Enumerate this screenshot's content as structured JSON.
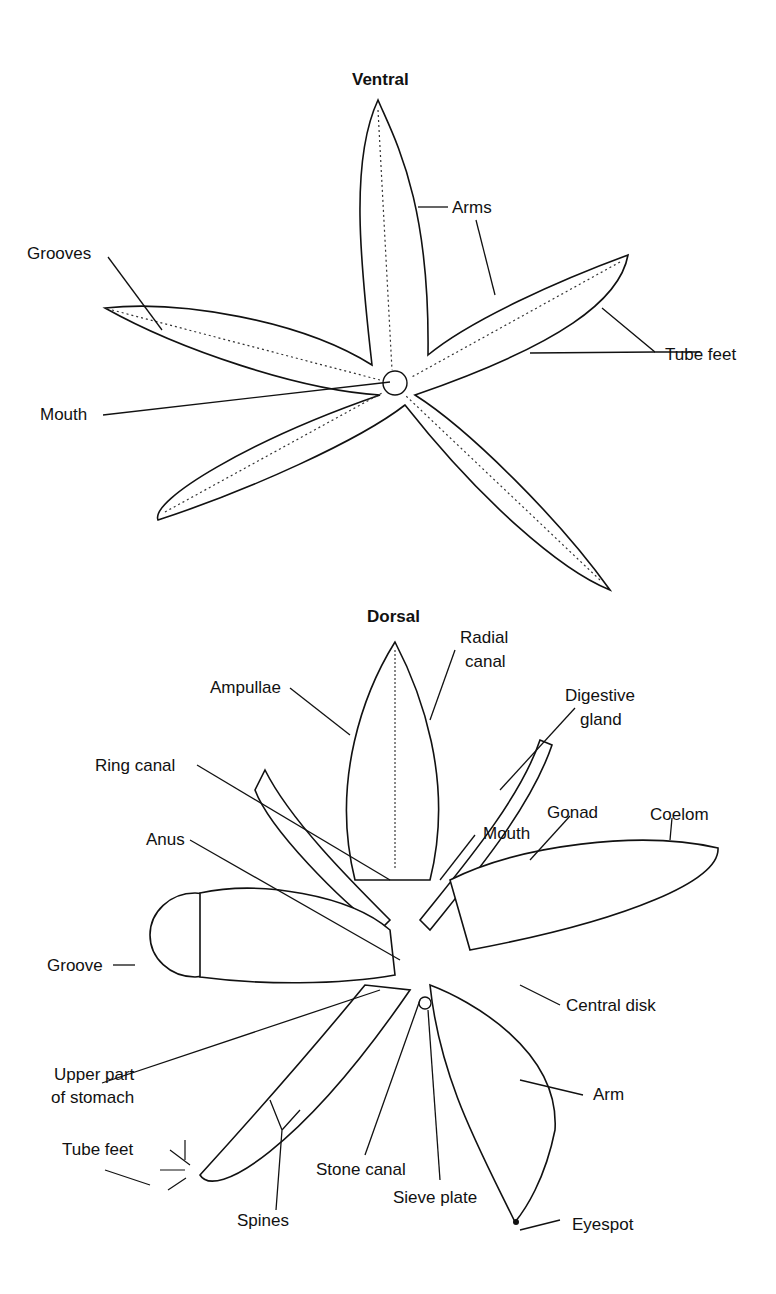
{
  "ventral": {
    "title": "Ventral",
    "labels": {
      "arms": "Arms",
      "grooves": "Grooves",
      "tube_feet": "Tube feet",
      "mouth": "Mouth"
    }
  },
  "dorsal": {
    "title": "Dorsal",
    "labels": {
      "radial_canal_1": "Radial",
      "radial_canal_2": "canal",
      "ampullae": "Ampullae",
      "digestive_gland_1": "Digestive",
      "digestive_gland_2": "gland",
      "ring_canal": "Ring canal",
      "gonad": "Gonad",
      "coelom": "Coelom",
      "anus": "Anus",
      "mouth": "Mouth",
      "groove": "Groove",
      "central_disk": "Central disk",
      "upper_stomach_1": "Upper part",
      "upper_stomach_2": "of stomach",
      "arm": "Arm",
      "tube_feet": "Tube feet",
      "stone_canal": "Stone canal",
      "sieve_plate": "Sieve plate",
      "spines": "Spines",
      "eyespot": "Eyespot"
    }
  }
}
